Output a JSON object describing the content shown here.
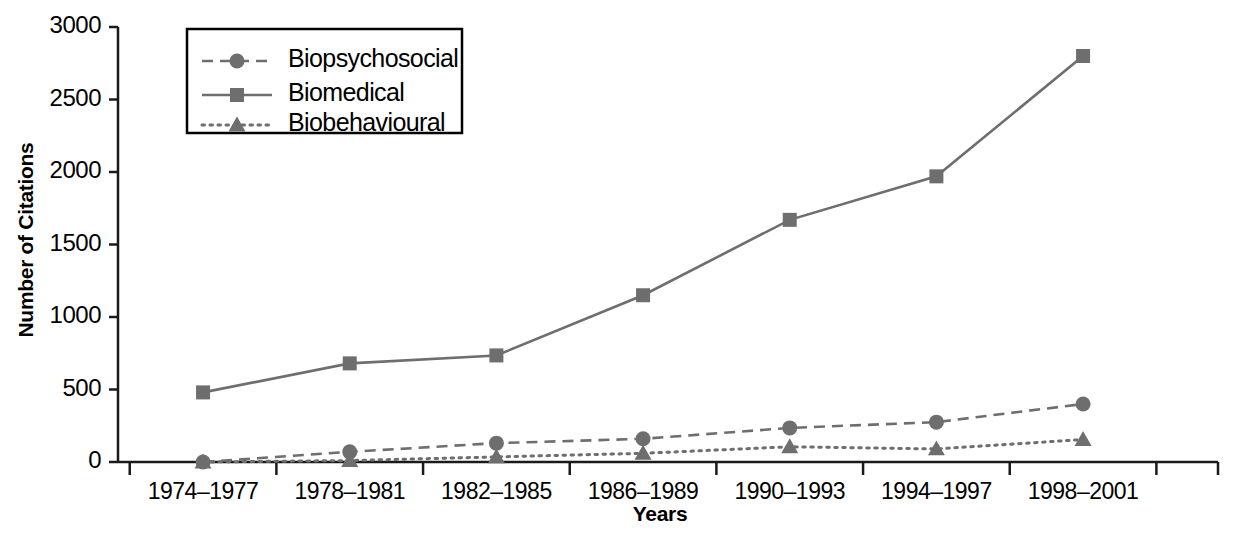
{
  "chart_data": {
    "type": "line",
    "title": "",
    "xlabel": "Years",
    "ylabel": "Number of Citations",
    "categories": [
      "1974–1977",
      "1978–1981",
      "1982–1985",
      "1986–1989",
      "1990–1993",
      "1994–1997",
      "1998–2001"
    ],
    "ylim": [
      0,
      3000
    ],
    "yticks": [
      0,
      500,
      1000,
      1500,
      2000,
      2500,
      3000
    ],
    "ytick_labels": [
      "0",
      "500",
      "1000",
      "1500",
      "2000",
      "2500",
      "3000"
    ],
    "grid": false,
    "legend_position": "upper-left-inside",
    "series": [
      {
        "name": "Biopsychosocial",
        "values": [
          0,
          70,
          130,
          160,
          235,
          275,
          400
        ],
        "marker": "circle",
        "line_style": "dashed",
        "color": "#6e6e6e"
      },
      {
        "name": "Biomedical",
        "values": [
          480,
          680,
          735,
          1150,
          1670,
          1970,
          2800
        ],
        "marker": "square",
        "line_style": "solid",
        "color": "#6e6e6e"
      },
      {
        "name": "Biobehavioural",
        "values": [
          0,
          10,
          35,
          60,
          105,
          90,
          155
        ],
        "marker": "triangle",
        "line_style": "dotted",
        "color": "#6e6e6e"
      }
    ]
  },
  "legend": {
    "items": [
      {
        "label": "Biopsychosocial"
      },
      {
        "label": "Biomedical"
      },
      {
        "label": "Biobehavioural"
      }
    ]
  },
  "axes": {
    "y_title": "Number of Citations",
    "x_title": "Years"
  },
  "colors": {
    "axis": "#1a1a1a",
    "series": "#6e6e6e",
    "background": "#ffffff",
    "text": "#000000"
  }
}
